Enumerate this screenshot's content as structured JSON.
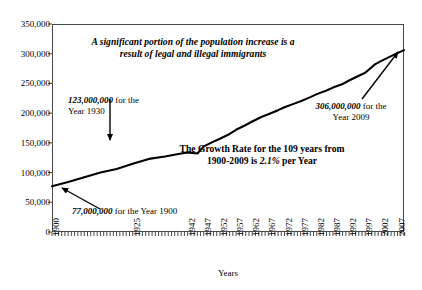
{
  "chart_data": {
    "type": "line",
    "title": "for the United States",
    "xlabel": "Years",
    "ylabel": "",
    "xlim": [
      1900,
      2009
    ],
    "ylim": [
      0,
      350000
    ],
    "grid": false,
    "legend": "none",
    "y_ticks": [
      "0",
      "50,000",
      "100,000",
      "150,000",
      "200,000",
      "250,000",
      "300,000",
      "350,000"
    ],
    "y_tick_values": [
      0,
      50000,
      100000,
      150000,
      200000,
      250000,
      300000,
      350000
    ],
    "x_tick_labels": [
      "1900",
      "1925",
      "1942",
      "1947",
      "1952",
      "1957",
      "1962",
      "1967",
      "1972",
      "1977",
      "1982",
      "1987",
      "1992",
      "1997",
      "2002",
      "2007"
    ],
    "x_tick_positions": [
      1900,
      1925,
      1942,
      1947,
      1952,
      1957,
      1962,
      1967,
      1972,
      1977,
      1982,
      1987,
      1992,
      1997,
      2002,
      2007
    ],
    "series": [
      {
        "name": "United States Population (thousands)",
        "x": [
          1900,
          1905,
          1910,
          1915,
          1920,
          1925,
          1930,
          1935,
          1940,
          1942,
          1945,
          1947,
          1950,
          1952,
          1955,
          1957,
          1960,
          1962,
          1965,
          1967,
          1970,
          1972,
          1975,
          1977,
          1980,
          1982,
          1985,
          1987,
          1990,
          1992,
          1995,
          1997,
          2000,
          2002,
          2005,
          2007,
          2009
        ],
        "values": [
          77000,
          84000,
          92000,
          100000,
          106000,
          115000,
          123000,
          127000,
          132000,
          134000,
          132000,
          144000,
          152000,
          157000,
          165000,
          172000,
          180000,
          186000,
          194000,
          198000,
          205000,
          210000,
          216000,
          220000,
          227000,
          232000,
          238000,
          243000,
          249000,
          255000,
          263000,
          268000,
          282000,
          288000,
          296000,
          301000,
          306000
        ]
      }
    ],
    "annotations": [
      {
        "name": "immigrants-note",
        "text": "A significant portion of the population increase is a\nresult of legal and illegal immigrants"
      },
      {
        "name": "point-1930",
        "value_text": "123,000,000",
        "rest_text": " for the\nYear 1930",
        "year": 1930,
        "value": 123000000
      },
      {
        "name": "point-2009",
        "value_text": "306,000,000",
        "rest_text": " for the\nYear 2009",
        "year": 2009,
        "value": 306000000
      },
      {
        "name": "growth-rate-note",
        "line1": "The Growth Rate for the 109 years from",
        "line2_pre": "1900-2009 is ",
        "line2_em": "2.1%",
        "line2_post": " per Year",
        "rate_percent": 2.1,
        "span_years": 109
      },
      {
        "name": "point-1900",
        "value_text": "77,000,000",
        "rest_text": " for the Year 1900",
        "year": 1900,
        "value": 77000000
      }
    ],
    "colors": {
      "line": "#000000",
      "frame": "#4a4a4a",
      "text": "#000000",
      "background": "#ffffff"
    }
  }
}
